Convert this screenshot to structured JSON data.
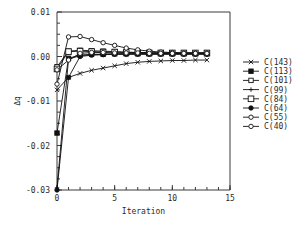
{
  "chart_data": {
    "type": "line",
    "title": "",
    "xlabel": "Iteration",
    "ylabel": "Δq",
    "xlim": [
      0,
      15
    ],
    "ylim": [
      -0.03,
      0.01
    ],
    "xticks": [
      0,
      5,
      10,
      15
    ],
    "xticklabels": [
      "0",
      "5",
      "10",
      "15"
    ],
    "xminorticks": [
      0,
      1,
      2,
      3,
      4,
      5,
      6,
      7,
      8,
      9,
      10,
      11,
      12,
      13,
      14,
      15
    ],
    "yticks": [
      0.01,
      0.0,
      -0.01,
      -0.02,
      -0.03
    ],
    "yticklabels": [
      "0.01",
      "0.00",
      "-0.01",
      "-0.02",
      "-0.03"
    ],
    "grid": false,
    "legend_position": "right",
    "x": [
      0,
      1,
      2,
      3,
      4,
      5,
      6,
      7,
      8,
      9,
      10,
      11,
      12,
      13
    ],
    "series": [
      {
        "name": "C(143)",
        "marker": "x",
        "values": [
          -0.0075,
          -0.0047,
          -0.0038,
          -0.0031,
          -0.0026,
          -0.0021,
          -0.0016,
          -0.0013,
          -0.0011,
          -0.001,
          -0.0009,
          -0.0009,
          -0.0008,
          -0.0008
        ]
      },
      {
        "name": "C(113)",
        "marker": "filled-square",
        "values": [
          -0.0172,
          -0.0004,
          0.0003,
          0.0005,
          0.0005,
          0.0006,
          0.0006,
          0.0006,
          0.0006,
          0.0006,
          0.0006,
          0.0006,
          0.0006,
          0.0006
        ]
      },
      {
        "name": "C(101)",
        "marker": "open-square",
        "values": [
          -0.0023,
          0.0012,
          0.0014,
          0.0013,
          0.0012,
          0.0011,
          0.001,
          0.0009,
          0.0009,
          0.0008,
          0.0008,
          0.0008,
          0.0008,
          0.0008
        ]
      },
      {
        "name": "C(99)",
        "marker": "plus",
        "values": [
          -0.0295,
          -0.0006,
          0.0002,
          0.0004,
          0.0005,
          0.0005,
          0.0006,
          0.0006,
          0.0006,
          0.0006,
          0.0006,
          0.0006,
          0.0006,
          0.0006
        ]
      },
      {
        "name": "C(84)",
        "marker": "open-square-large",
        "values": [
          -0.0028,
          0.0011,
          0.0012,
          0.0011,
          0.001,
          0.001,
          0.0009,
          0.0009,
          0.0008,
          0.0008,
          0.0008,
          0.0008,
          0.0008,
          0.0008
        ]
      },
      {
        "name": "C(64)",
        "marker": "filled-circle",
        "values": [
          -0.03,
          -0.0047,
          0.0,
          0.0003,
          0.0004,
          0.0005,
          0.0005,
          0.0005,
          0.0005,
          0.0005,
          0.0005,
          0.0005,
          0.0005,
          0.0005
        ]
      },
      {
        "name": "C(55)",
        "marker": "open-circle",
        "values": [
          -0.0062,
          0.0044,
          0.0045,
          0.0038,
          0.0031,
          0.0025,
          0.0019,
          0.0015,
          0.0012,
          0.001,
          0.0009,
          0.0008,
          0.0008,
          0.0008
        ]
      },
      {
        "name": "C(40)",
        "marker": "open-circle",
        "values": [
          -0.003,
          -0.0008,
          0.0007,
          0.0009,
          0.0009,
          0.0008,
          0.0008,
          0.0008,
          0.0007,
          0.0007,
          0.0007,
          0.0007,
          0.0007,
          0.0007
        ]
      }
    ]
  }
}
